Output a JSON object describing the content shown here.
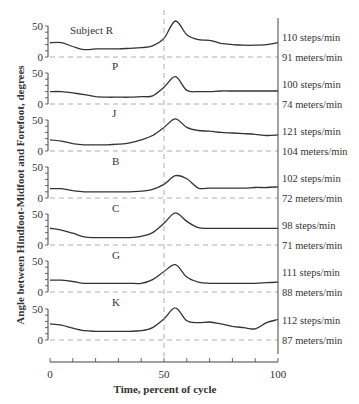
{
  "chart_data": {
    "type": "line",
    "title": "",
    "xlabel": "Time, percent of cycle",
    "ylabel": "Angle between Hindfoot-Midfoot and Forefoot, degrees",
    "xlim": [
      0,
      100
    ],
    "x_ticks": [
      "0",
      "50",
      "100"
    ],
    "y_ticks_per_panel": [
      "0",
      "50"
    ],
    "ylim": [
      0,
      50
    ],
    "grid": false,
    "reference_lines": {
      "vertical_x": 50,
      "horizontal_y": 0
    },
    "x": [
      0,
      5,
      10,
      15,
      20,
      25,
      30,
      35,
      40,
      45,
      50,
      55,
      60,
      65,
      70,
      75,
      80,
      85,
      90,
      95,
      100
    ],
    "series": [
      {
        "name": "Subject R",
        "label": "Subject R",
        "steps": "110 steps/min",
        "speed": "91 meters/min",
        "values": [
          23,
          23,
          17,
          12,
          13,
          13,
          13,
          14,
          15,
          18,
          30,
          58,
          36,
          28,
          27,
          22,
          20,
          19,
          19,
          20,
          23
        ]
      },
      {
        "name": "P",
        "label": "P",
        "steps": "100 steps/min",
        "speed": "74 meters/min",
        "values": [
          20,
          20,
          18,
          15,
          12,
          11,
          11,
          11,
          12,
          13,
          27,
          44,
          22,
          20,
          20,
          21,
          21,
          21,
          21,
          21,
          21
        ]
      },
      {
        "name": "J",
        "label": "J",
        "steps": "121 steps/min",
        "speed": "104 meters/min",
        "values": [
          18,
          16,
          12,
          10,
          10,
          10,
          11,
          13,
          18,
          25,
          38,
          52,
          38,
          33,
          32,
          30,
          29,
          28,
          27,
          25,
          26
        ]
      },
      {
        "name": "B",
        "label": "B",
        "steps": "102 steps/min",
        "speed": "72 meters/min",
        "values": [
          15,
          15,
          12,
          10,
          10,
          10,
          10,
          10,
          11,
          14,
          22,
          36,
          31,
          16,
          16,
          16,
          16,
          16,
          17,
          17,
          18
        ]
      },
      {
        "name": "C",
        "label": "C",
        "steps": "98 steps/min",
        "speed": "71 meters/min",
        "values": [
          27,
          24,
          19,
          13,
          12,
          12,
          12,
          12,
          14,
          20,
          35,
          52,
          38,
          28,
          27,
          27,
          27,
          27,
          27,
          27,
          27
        ]
      },
      {
        "name": "G",
        "label": "G",
        "steps": "111 steps/min",
        "speed": "88 meters/min",
        "values": [
          19,
          19,
          17,
          14,
          14,
          14,
          14,
          14,
          14,
          20,
          33,
          44,
          24,
          16,
          14,
          14,
          14,
          14,
          14,
          15,
          16
        ]
      },
      {
        "name": "K",
        "label": "K",
        "steps": "112 steps/min",
        "speed": "87 meters/min",
        "values": [
          26,
          24,
          19,
          15,
          14,
          14,
          14,
          14,
          15,
          20,
          34,
          52,
          31,
          28,
          29,
          26,
          22,
          20,
          18,
          28,
          33
        ]
      }
    ]
  },
  "labels": {
    "ylabel": "Angle between Hindfoot-Midfoot and Forefoot, degrees",
    "xlabel": "Time, percent of cycle",
    "x0": "0",
    "x50": "50",
    "x100": "100",
    "y0": "0",
    "y50": "50"
  }
}
